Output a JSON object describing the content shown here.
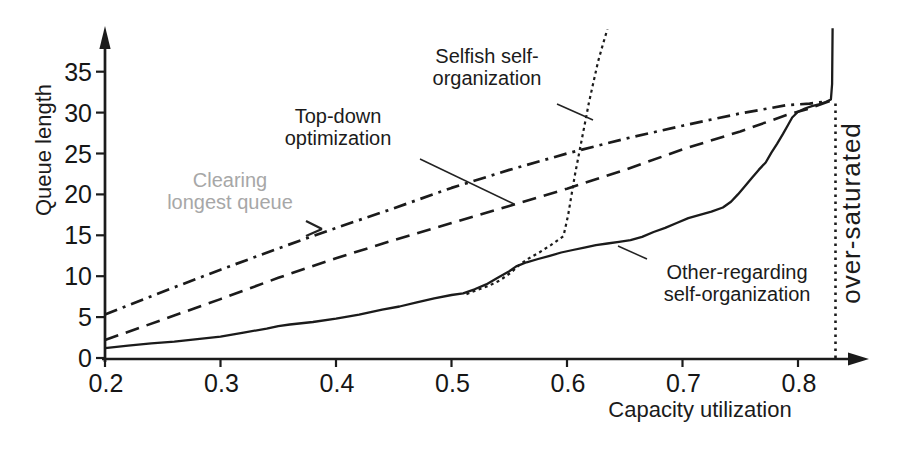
{
  "figure": {
    "background": "#ffffff",
    "ink_color": "#1b1b1b",
    "muted_label_color": "#a7a7a7"
  },
  "chart_data": {
    "type": "line",
    "title": "",
    "xlabel": "Capacity utilization",
    "ylabel": "Queue length",
    "xlim": [
      0.2,
      0.87
    ],
    "ylim": [
      0,
      39.5
    ],
    "grid": false,
    "legend_position": "inline-annotations",
    "x_ticks": {
      "values": [
        0.2,
        0.3,
        0.4,
        0.5,
        0.6,
        0.7,
        0.8
      ],
      "labels": [
        "0.2",
        "0.3",
        "0.4",
        "0.5",
        "0.6",
        "0.7",
        "0.8"
      ]
    },
    "y_ticks": {
      "values": [
        0,
        5,
        10,
        15,
        20,
        25,
        30,
        35
      ],
      "labels": [
        "0",
        "5",
        "10",
        "15",
        "20",
        "25",
        "30",
        "35"
      ]
    },
    "series": [
      {
        "id": "clearing",
        "name": "Clearing longest queue",
        "line_style": "dashdot",
        "points": [
          [
            0.2,
            5.3
          ],
          [
            0.25,
            8.1
          ],
          [
            0.3,
            10.8
          ],
          [
            0.35,
            13.4
          ],
          [
            0.4,
            15.9
          ],
          [
            0.45,
            18.3
          ],
          [
            0.5,
            20.8
          ],
          [
            0.55,
            23.0
          ],
          [
            0.6,
            25.0
          ],
          [
            0.65,
            26.8
          ],
          [
            0.7,
            28.4
          ],
          [
            0.75,
            29.9
          ],
          [
            0.79,
            30.9
          ],
          [
            0.81,
            31.1
          ],
          [
            0.8275,
            31.4
          ]
        ]
      },
      {
        "id": "topdown",
        "name": "Top-down optimization",
        "line_style": "dashed",
        "points": [
          [
            0.2,
            2.2
          ],
          [
            0.25,
            4.7
          ],
          [
            0.3,
            7.2
          ],
          [
            0.35,
            9.8
          ],
          [
            0.4,
            12.2
          ],
          [
            0.45,
            14.4
          ],
          [
            0.5,
            16.5
          ],
          [
            0.55,
            18.6
          ],
          [
            0.6,
            20.7
          ],
          [
            0.65,
            23.0
          ],
          [
            0.7,
            25.5
          ],
          [
            0.75,
            27.7
          ],
          [
            0.79,
            29.7
          ],
          [
            0.81,
            30.5
          ],
          [
            0.8275,
            31.4
          ]
        ]
      },
      {
        "id": "selfish",
        "name": "Selfish self-organization",
        "line_style": "dotted",
        "points": [
          [
            0.513,
            7.8
          ],
          [
            0.522,
            8.3
          ],
          [
            0.532,
            8.8
          ],
          [
            0.542,
            9.5
          ],
          [
            0.552,
            10.5
          ],
          [
            0.558,
            11.3
          ],
          [
            0.566,
            12.1
          ],
          [
            0.576,
            12.9
          ],
          [
            0.586,
            13.8
          ],
          [
            0.597,
            14.9
          ],
          [
            0.601,
            17.5
          ],
          [
            0.604,
            20.0
          ],
          [
            0.607,
            22.5
          ],
          [
            0.611,
            25.4
          ],
          [
            0.615,
            28.3
          ],
          [
            0.619,
            31.2
          ],
          [
            0.623,
            33.8
          ],
          [
            0.627,
            36.3
          ],
          [
            0.631,
            38.3
          ],
          [
            0.635,
            40.2
          ]
        ]
      },
      {
        "id": "other",
        "name": "Other-regarding self-organization",
        "line_style": "solid",
        "points": [
          [
            0.2,
            1.2
          ],
          [
            0.22,
            1.5
          ],
          [
            0.24,
            1.8
          ],
          [
            0.26,
            2.0
          ],
          [
            0.28,
            2.3
          ],
          [
            0.3,
            2.6
          ],
          [
            0.32,
            3.1
          ],
          [
            0.34,
            3.6
          ],
          [
            0.35,
            3.9
          ],
          [
            0.36,
            4.1
          ],
          [
            0.38,
            4.4
          ],
          [
            0.4,
            4.8
          ],
          [
            0.42,
            5.3
          ],
          [
            0.44,
            5.9
          ],
          [
            0.455,
            6.3
          ],
          [
            0.47,
            6.8
          ],
          [
            0.485,
            7.3
          ],
          [
            0.5,
            7.7
          ],
          [
            0.51,
            7.9
          ],
          [
            0.52,
            8.4
          ],
          [
            0.53,
            9.0
          ],
          [
            0.54,
            9.8
          ],
          [
            0.55,
            10.6
          ],
          [
            0.556,
            11.2
          ],
          [
            0.565,
            11.7
          ],
          [
            0.575,
            12.1
          ],
          [
            0.585,
            12.5
          ],
          [
            0.595,
            12.9
          ],
          [
            0.605,
            13.2
          ],
          [
            0.615,
            13.5
          ],
          [
            0.625,
            13.8
          ],
          [
            0.635,
            14.0
          ],
          [
            0.645,
            14.2
          ],
          [
            0.655,
            14.4
          ],
          [
            0.665,
            14.8
          ],
          [
            0.675,
            15.4
          ],
          [
            0.685,
            15.9
          ],
          [
            0.695,
            16.5
          ],
          [
            0.705,
            17.1
          ],
          [
            0.715,
            17.5
          ],
          [
            0.725,
            17.9
          ],
          [
            0.735,
            18.4
          ],
          [
            0.742,
            19.1
          ],
          [
            0.748,
            20.0
          ],
          [
            0.754,
            21.0
          ],
          [
            0.76,
            22.0
          ],
          [
            0.766,
            23.0
          ],
          [
            0.772,
            23.9
          ],
          [
            0.777,
            25.1
          ],
          [
            0.782,
            26.2
          ],
          [
            0.787,
            27.4
          ],
          [
            0.791,
            28.4
          ],
          [
            0.795,
            29.4
          ],
          [
            0.8,
            30.1
          ],
          [
            0.806,
            30.5
          ],
          [
            0.812,
            30.8
          ],
          [
            0.818,
            31.0
          ],
          [
            0.824,
            31.3
          ],
          [
            0.8285,
            31.6
          ],
          [
            0.8295,
            33.5
          ],
          [
            0.83,
            40.3
          ]
        ]
      },
      {
        "id": "saturation-threshold",
        "name": "over-saturated",
        "line_style": "dotted-vertical",
        "points": [
          [
            0.8325,
            0
          ],
          [
            0.8325,
            31.5
          ]
        ]
      }
    ],
    "annotations": {
      "selfish": {
        "line1": "Selfish self-",
        "line2": "organization"
      },
      "topdown": {
        "line1": "Top-down",
        "line2": "optimization"
      },
      "clearing": {
        "line1": "Clearing",
        "line2": "longest queue"
      },
      "other": {
        "line1": "Other-regarding",
        "line2": "self-organization"
      },
      "oversaturated": "over-saturated"
    }
  }
}
